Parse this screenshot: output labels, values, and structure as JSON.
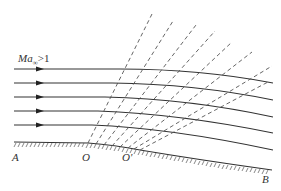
{
  "diagram": {
    "freestream_label": {
      "symbol": "Ma",
      "subscript": "∞",
      "relation": ">1"
    },
    "points": {
      "A": "A",
      "O": "O",
      "O_prime": "O'",
      "B": "B"
    },
    "streamline_count": 5,
    "mach_wave_count": 8,
    "colors": {
      "line": "#333333",
      "dashed": "#555555",
      "background": "#ffffff"
    }
  }
}
